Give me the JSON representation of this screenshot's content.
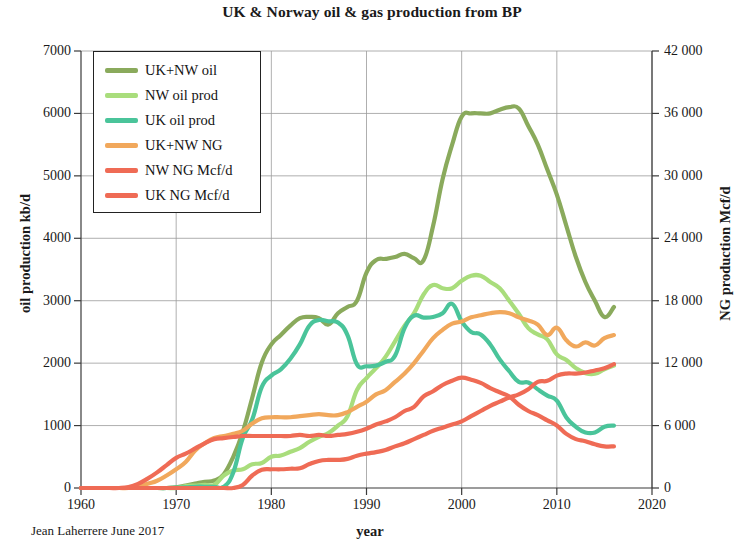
{
  "chart_data": {
    "type": "line",
    "title": "UK & Norway oil & gas production from BP",
    "xlabel": "year",
    "ylabel": "oil production kb/d",
    "ylabel_right": "NG production Mcf/d",
    "credit": "Jean Laherrere June 2017",
    "xlim": [
      1960,
      2020
    ],
    "ylim": [
      0,
      7000
    ],
    "ylim_right": [
      0,
      42000
    ],
    "grid": true,
    "legend_position": "upper-left-inside",
    "xticks": [
      "1960",
      "1970",
      "1980",
      "1990",
      "2000",
      "2010",
      "2020"
    ],
    "xtick_values": [
      1960,
      1970,
      1980,
      1990,
      2000,
      2010,
      2020
    ],
    "yticks_left": [
      "0",
      "1000",
      "2000",
      "3000",
      "4000",
      "5000",
      "6000",
      "7000"
    ],
    "ytick_values_left": [
      0,
      1000,
      2000,
      3000,
      4000,
      5000,
      6000,
      7000
    ],
    "yticks_right": [
      "0",
      "6 000",
      "12 000",
      "18 000",
      "24 000",
      "30 000",
      "36 000",
      "42 000"
    ],
    "ytick_values_right": [
      0,
      6000,
      12000,
      18000,
      24000,
      30000,
      36000,
      42000
    ],
    "x": [
      1960,
      1961,
      1962,
      1963,
      1964,
      1965,
      1966,
      1967,
      1968,
      1969,
      1970,
      1971,
      1972,
      1973,
      1974,
      1975,
      1976,
      1977,
      1978,
      1979,
      1980,
      1981,
      1982,
      1983,
      1984,
      1985,
      1986,
      1987,
      1988,
      1989,
      1990,
      1991,
      1992,
      1993,
      1994,
      1995,
      1996,
      1997,
      1998,
      1999,
      2000,
      2001,
      2002,
      2003,
      2004,
      2005,
      2006,
      2007,
      2008,
      2009,
      2010,
      2011,
      2012,
      2013,
      2014,
      2015,
      2016
    ],
    "series": [
      {
        "name": "UK+NW oil",
        "axis": "left",
        "unit": "kb/d",
        "color": "#8aaa5c",
        "values": [
          0,
          0,
          0,
          0,
          0,
          0,
          0,
          0,
          0,
          0,
          10,
          40,
          70,
          100,
          120,
          220,
          500,
          900,
          1450,
          2010,
          2300,
          2450,
          2600,
          2720,
          2740,
          2720,
          2620,
          2800,
          2900,
          3000,
          3450,
          3650,
          3670,
          3700,
          3750,
          3680,
          3650,
          4200,
          4950,
          5500,
          5950,
          6000,
          6000,
          6000,
          6060,
          6100,
          6080,
          5800,
          5500,
          5100,
          4700,
          4200,
          3700,
          3300,
          3000,
          2740,
          2900
        ]
      },
      {
        "name": "NW oil prod",
        "axis": "left",
        "unit": "kb/d",
        "color": "#a9dd7c",
        "values": [
          0,
          0,
          0,
          0,
          0,
          0,
          0,
          0,
          0,
          0,
          0,
          30,
          40,
          50,
          50,
          200,
          280,
          300,
          380,
          400,
          500,
          520,
          580,
          640,
          740,
          820,
          880,
          1000,
          1150,
          1570,
          1760,
          1920,
          2100,
          2350,
          2600,
          2800,
          3100,
          3250,
          3200,
          3200,
          3320,
          3400,
          3400,
          3300,
          3200,
          3000,
          2790,
          2560,
          2460,
          2380,
          2140,
          2050,
          1920,
          1840,
          1830,
          1900,
          1960
        ]
      },
      {
        "name": "UK oil prod",
        "axis": "left",
        "unit": "kb/d",
        "color": "#4ac49a",
        "values": [
          0,
          0,
          0,
          0,
          0,
          0,
          0,
          0,
          0,
          0,
          5,
          10,
          20,
          20,
          20,
          20,
          250,
          800,
          1100,
          1620,
          1800,
          1900,
          2070,
          2300,
          2600,
          2690,
          2670,
          2650,
          2450,
          1980,
          1950,
          1960,
          2020,
          2120,
          2560,
          2760,
          2730,
          2740,
          2800,
          2950,
          2670,
          2500,
          2460,
          2300,
          2060,
          1870,
          1700,
          1690,
          1580,
          1480,
          1400,
          1130,
          980,
          890,
          890,
          980,
          1000
        ]
      },
      {
        "name": "UK+NW NG",
        "axis": "right",
        "unit": "Mcf/d",
        "color": "#f1a85c",
        "values": [
          0,
          0,
          0,
          0,
          0,
          0,
          100,
          400,
          700,
          1200,
          1800,
          2500,
          3600,
          4300,
          4800,
          5000,
          5200,
          5500,
          6200,
          6700,
          6800,
          6800,
          6800,
          6900,
          7000,
          7100,
          7000,
          7000,
          7300,
          7800,
          8300,
          9000,
          9400,
          10200,
          11000,
          12000,
          13200,
          14400,
          15200,
          15800,
          16000,
          16400,
          16600,
          16800,
          16900,
          16800,
          16400,
          16100,
          15700,
          14700,
          15400,
          14200,
          13600,
          14000,
          13700,
          14400,
          14700
        ]
      },
      {
        "name": "NW NG Mcf/d",
        "axis": "right",
        "unit": "Mcf/d",
        "color": "#ef6b55",
        "values": [
          0,
          0,
          0,
          0,
          0,
          0,
          0,
          0,
          0,
          0,
          0,
          0,
          0,
          0,
          0,
          0,
          0,
          300,
          1200,
          1750,
          1800,
          1800,
          1850,
          1900,
          2300,
          2600,
          2700,
          2700,
          2800,
          3100,
          3300,
          3450,
          3650,
          4000,
          4300,
          4700,
          5100,
          5500,
          5800,
          6100,
          6400,
          6900,
          7400,
          7900,
          8300,
          8700,
          9000,
          9500,
          10200,
          10300,
          10800,
          11000,
          11000,
          11100,
          11300,
          11500,
          11900
        ]
      },
      {
        "name": "UK NG Mcf/d",
        "axis": "right",
        "unit": "Mcf/d",
        "color": "#ef6b55",
        "values": [
          0,
          0,
          0,
          0,
          0,
          100,
          400,
          900,
          1500,
          2200,
          2900,
          3300,
          3800,
          4300,
          4700,
          4800,
          4900,
          5000,
          5000,
          5000,
          5000,
          5000,
          5000,
          5100,
          5000,
          5100,
          5000,
          5100,
          5200,
          5400,
          5700,
          6100,
          6400,
          6800,
          7400,
          7800,
          8800,
          9300,
          9900,
          10300,
          10600,
          10400,
          10100,
          9600,
          9200,
          8800,
          8000,
          7400,
          7000,
          6500,
          6000,
          5200,
          4700,
          4500,
          4200,
          4000,
          4000
        ]
      }
    ]
  },
  "legend": {
    "items": [
      {
        "label": "UK+NW oil",
        "color": "#8aaa5c"
      },
      {
        "label": "NW oil prod",
        "color": "#a9dd7c"
      },
      {
        "label": "UK oil prod",
        "color": "#4ac49a"
      },
      {
        "label": "UK+NW NG",
        "color": "#f1a85c"
      },
      {
        "label": "NW NG Mcf/d",
        "color": "#ef6b55"
      },
      {
        "label": "UK NG Mcf/d",
        "color": "#ef6b55"
      }
    ]
  },
  "colors": {
    "axis": "#3a3a3a",
    "grid": "#9a9a9a",
    "text": "#1a1a1a",
    "background": "#ffffff"
  }
}
